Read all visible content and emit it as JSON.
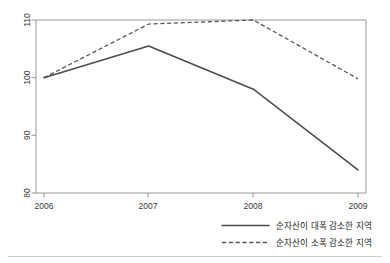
{
  "chart_data": {
    "type": "line",
    "title": "",
    "subtitle": "",
    "xlabel": "",
    "ylabel": "",
    "x": [
      "2006",
      "2007",
      "2008",
      "2009"
    ],
    "categories": [
      "2006",
      "2007",
      "2008",
      "2009"
    ],
    "xticklabels": [
      "2006",
      "2007",
      "2008",
      "2009"
    ],
    "yticklabels": [
      "80",
      "90",
      "100",
      "110"
    ],
    "yticks": [
      80,
      90,
      100,
      110
    ],
    "ylim": [
      80,
      110
    ],
    "xlim": [
      "2006",
      "2009"
    ],
    "grid": false,
    "legend_position": "bottom-right",
    "series": [
      {
        "name": "순자산이 대폭 감소한 지역",
        "style": "solid",
        "color": "#4c4c4c",
        "values": [
          100.0,
          105.5,
          98.0,
          84.0
        ]
      },
      {
        "name": "순자산이 소폭 감소한 지역",
        "style": "dashed",
        "color": "#5a5a5a",
        "values": [
          100.0,
          109.3,
          110.0,
          99.8
        ]
      }
    ],
    "annotations": []
  },
  "axes": {
    "y_tick_110": "110",
    "y_tick_100": "100",
    "y_tick_90": "90",
    "y_tick_80": "80",
    "x_tick_2006": "2006",
    "x_tick_2007": "2007",
    "x_tick_2008": "2008",
    "x_tick_2009": "2009"
  },
  "legend": {
    "entries": [
      {
        "label": "순자산이 대폭 감소한 지역",
        "style": "solid"
      },
      {
        "label": "순자산이 소폭 감소한 지역",
        "style": "dashed"
      }
    ]
  }
}
